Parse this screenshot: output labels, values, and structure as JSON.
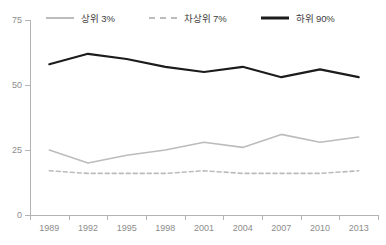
{
  "chart_data": {
    "type": "line",
    "title": "",
    "subtitle": "",
    "xlabel": "",
    "ylabel": "",
    "categories": [
      "1989",
      "1992",
      "1995",
      "1998",
      "2001",
      "2004",
      "2007",
      "2010",
      "2013"
    ],
    "x": [
      1989,
      1992,
      1995,
      1998,
      2001,
      2004,
      2007,
      2010,
      2013
    ],
    "ylim": [
      0,
      75
    ],
    "yticks": [
      0,
      25,
      50,
      75
    ],
    "ytick_labels": [
      "0",
      "25",
      "50",
      "75"
    ],
    "grid": false,
    "legend_position": "top",
    "series": [
      {
        "name": "상위 3%",
        "style": "solid",
        "color": "#bcbcbc",
        "values": [
          25,
          20,
          23,
          25,
          28,
          26,
          31,
          28,
          30
        ]
      },
      {
        "name": "차상위 7%",
        "style": "dashed",
        "color": "#bcbcbc",
        "values": [
          17,
          16,
          16,
          16,
          17,
          16,
          16,
          16,
          17
        ]
      },
      {
        "name": "하위 90%",
        "style": "solid",
        "color": "#1c1c1c",
        "values": [
          58,
          62,
          60,
          57,
          55,
          57,
          53,
          56,
          53
        ]
      }
    ]
  },
  "legend": {
    "items": [
      {
        "label": "상위 3%",
        "swatch": "line-solid-light-icon"
      },
      {
        "label": "차상위 7%",
        "swatch": "line-dashed-light-icon"
      },
      {
        "label": "하위 90%",
        "swatch": "line-solid-dark-icon"
      }
    ]
  },
  "axes": {
    "y_labels": [
      "75",
      "50",
      "25",
      "0"
    ],
    "x_labels": [
      "1989",
      "1992",
      "1995",
      "1998",
      "2001",
      "2004",
      "2007",
      "2010",
      "2013"
    ]
  }
}
